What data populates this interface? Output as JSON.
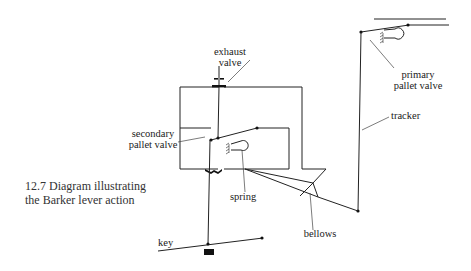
{
  "figure": {
    "caption_line1": "12.7  Diagram illustrating",
    "caption_line2": "the Barker lever action"
  },
  "labels": {
    "exhaust_line1": "exhaust",
    "exhaust_line2": "valve",
    "primary_line1": "primary",
    "primary_line2": "pallet valve",
    "tracker": "tracker",
    "secondary_line1": "secondary",
    "secondary_line2": "pallet valve",
    "spring": "spring",
    "bellows": "bellows",
    "key": "key"
  },
  "colors": {
    "line": "#222222",
    "text": "#1a1a1a",
    "background": "#ffffff"
  }
}
